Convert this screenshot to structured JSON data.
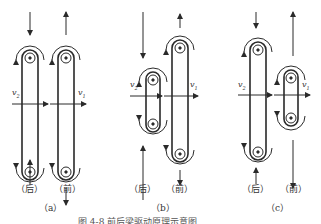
{
  "figure": {
    "caption": "图  4-8   前后梁驱动原理示意图",
    "panels": [
      {
        "id": "a",
        "label": "（a）",
        "rear_label": "（后）",
        "front_label": "（前）",
        "v_rear": "v",
        "v_rear_sub": "2",
        "v_front": "v",
        "v_front_sub": "1"
      },
      {
        "id": "b",
        "label": "（b）",
        "rear_label": "（后）",
        "front_label": "（前）",
        "v_rear": "v",
        "v_rear_sub": "2",
        "v_front": "v",
        "v_front_sub": "1"
      },
      {
        "id": "c",
        "label": "（c）",
        "rear_label": "（后）",
        "front_label": "（前）",
        "v_rear": "v",
        "v_rear_sub": "2",
        "v_front": "v",
        "v_front_sub": "1"
      }
    ]
  },
  "colors": {
    "stroke": "#2a2a2a",
    "background": "#ffffff"
  }
}
